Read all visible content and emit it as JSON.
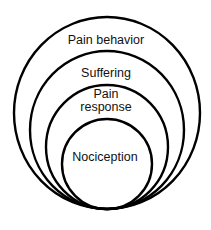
{
  "diagram": {
    "type": "nested-circles",
    "layers": [
      {
        "label": "Pain behavior",
        "level": 4
      },
      {
        "label": "Suffering",
        "level": 3
      },
      {
        "label": "Pain response",
        "label_lines": [
          "Pain",
          "response"
        ],
        "level": 2
      },
      {
        "label": "Nociception",
        "level": 1
      }
    ],
    "colors": {
      "stroke": "#000000",
      "background": "#ffffff",
      "text": "#111111"
    }
  }
}
